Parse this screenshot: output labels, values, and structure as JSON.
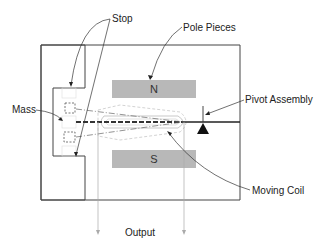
{
  "diagram": {
    "type": "moving-coil seismometer schematic",
    "labels": {
      "stop": "Stop",
      "pole_pieces": "Pole Pieces",
      "mass": "Mass",
      "pivot_assembly": "Pivot Assembly",
      "moving_coil": "Moving Coil",
      "output": "Output"
    },
    "poles": {
      "north": "N",
      "south": "S"
    },
    "colors": {
      "frame": "#444444",
      "pole_fill": "#b8b8b8",
      "coil_outline": "#bbbbbb",
      "leader": "#333333",
      "output_line": "#aaaaaa"
    }
  }
}
